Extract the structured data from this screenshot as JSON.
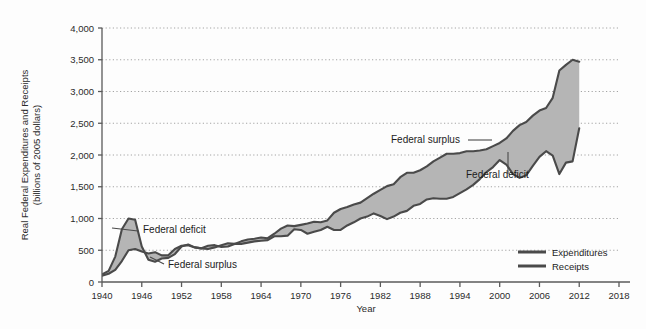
{
  "chart_data": {
    "type": "area",
    "title": "",
    "subtitle": "",
    "xlabel": "Year",
    "ylabel": "Real Federal Expenditures and Receipts (billions of 2005 dollars)",
    "ylabel_line1": "Real Federal Expenditures and Receipts",
    "ylabel_line2": "(billions of 2005 dollars)",
    "xlim": [
      1940,
      2018
    ],
    "ylim": [
      0,
      4000
    ],
    "grid": "horizontal-dotted",
    "legend_position": "bottom-right",
    "xticks": [
      1940,
      1946,
      1952,
      1958,
      1964,
      1970,
      1976,
      1982,
      1988,
      1994,
      2000,
      2006,
      2012,
      2018
    ],
    "xtick_labels": [
      "1940",
      "1946",
      "1952",
      "1958",
      "1964",
      "1970",
      "1976",
      "1982",
      "1988",
      "1994",
      "2000",
      "2006",
      "2012",
      "2018"
    ],
    "yticks": [
      0,
      500,
      1000,
      1500,
      2000,
      2500,
      3000,
      3500,
      4000
    ],
    "ytick_labels": [
      "0",
      "500",
      "1,000",
      "1,500",
      "2,000",
      "2,500",
      "3,000",
      "3,500",
      "4,000"
    ],
    "x": [
      1940,
      1941,
      1942,
      1943,
      1944,
      1945,
      1946,
      1947,
      1948,
      1949,
      1950,
      1951,
      1952,
      1953,
      1954,
      1955,
      1956,
      1957,
      1958,
      1959,
      1960,
      1961,
      1962,
      1963,
      1964,
      1965,
      1966,
      1967,
      1968,
      1969,
      1970,
      1971,
      1972,
      1973,
      1974,
      1975,
      1976,
      1977,
      1978,
      1979,
      1980,
      1981,
      1982,
      1983,
      1984,
      1985,
      1986,
      1987,
      1988,
      1989,
      1990,
      1991,
      1992,
      1993,
      1994,
      1995,
      1996,
      1997,
      1998,
      1999,
      2000,
      2001,
      2002,
      2003,
      2004,
      2005,
      2006,
      2007,
      2008,
      2009,
      2010,
      2011,
      2012
    ],
    "series": [
      {
        "name": "Expenditures",
        "color": "#4a4a4a",
        "values": [
          120,
          175,
          400,
          830,
          1000,
          980,
          560,
          350,
          320,
          370,
          380,
          440,
          560,
          590,
          545,
          530,
          520,
          545,
          580,
          610,
          600,
          640,
          670,
          680,
          700,
          690,
          760,
          840,
          890,
          880,
          900,
          920,
          950,
          940,
          970,
          1090,
          1150,
          1180,
          1220,
          1250,
          1320,
          1390,
          1450,
          1510,
          1540,
          1650,
          1720,
          1720,
          1760,
          1820,
          1900,
          1960,
          2020,
          2020,
          2030,
          2060,
          2060,
          2070,
          2090,
          2140,
          2190,
          2260,
          2380,
          2470,
          2520,
          2620,
          2700,
          2740,
          2900,
          3330,
          3420,
          3500,
          3470
        ],
        "endpoint_drop": true
      },
      {
        "name": "Receipts",
        "color": "#4a4a4a",
        "values": [
          100,
          130,
          190,
          330,
          500,
          520,
          480,
          450,
          470,
          420,
          420,
          520,
          570,
          580,
          545,
          530,
          570,
          580,
          550,
          560,
          600,
          600,
          620,
          640,
          650,
          660,
          720,
          720,
          730,
          830,
          820,
          760,
          790,
          820,
          870,
          820,
          820,
          890,
          940,
          1000,
          1030,
          1080,
          1040,
          990,
          1030,
          1090,
          1120,
          1200,
          1230,
          1300,
          1320,
          1310,
          1310,
          1340,
          1400,
          1460,
          1530,
          1620,
          1730,
          1810,
          1920,
          1850,
          1700,
          1640,
          1680,
          1830,
          1970,
          2060,
          1990,
          1700,
          1880,
          1900,
          2420
        ],
        "endpoint_rise": true
      }
    ],
    "band": {
      "label_deficit": "Federal deficit",
      "label_surplus": "Federal surplus",
      "fill_color": "#b5b5b5"
    },
    "annotations": [
      {
        "id": "deficit-1940s",
        "text": "Federal deficit",
        "x": 143,
        "y": 233,
        "anchor": "start",
        "leader": [
          [
            138,
            231
          ],
          [
            112,
            228
          ]
        ]
      },
      {
        "id": "surplus-1950s",
        "text": "Federal surplus",
        "x": 168,
        "y": 268,
        "anchor": "start",
        "leader": [
          [
            164,
            264
          ],
          [
            150,
            257
          ]
        ]
      },
      {
        "id": "surplus-2000",
        "text": "Federal surplus",
        "x": 391,
        "y": 143,
        "anchor": "start",
        "leader": [
          [
            468,
            140
          ],
          [
            492,
            140
          ]
        ]
      },
      {
        "id": "deficit-2003",
        "text": "Federal deficit",
        "x": 466,
        "y": 178,
        "anchor": "start",
        "leader": [
          [
            508,
            174
          ],
          [
            508,
            152
          ]
        ]
      }
    ],
    "legend": [
      {
        "label": "Expenditures",
        "color": "#4a4a4a"
      },
      {
        "label": "Receipts",
        "color": "#4a4a4a"
      }
    ]
  }
}
